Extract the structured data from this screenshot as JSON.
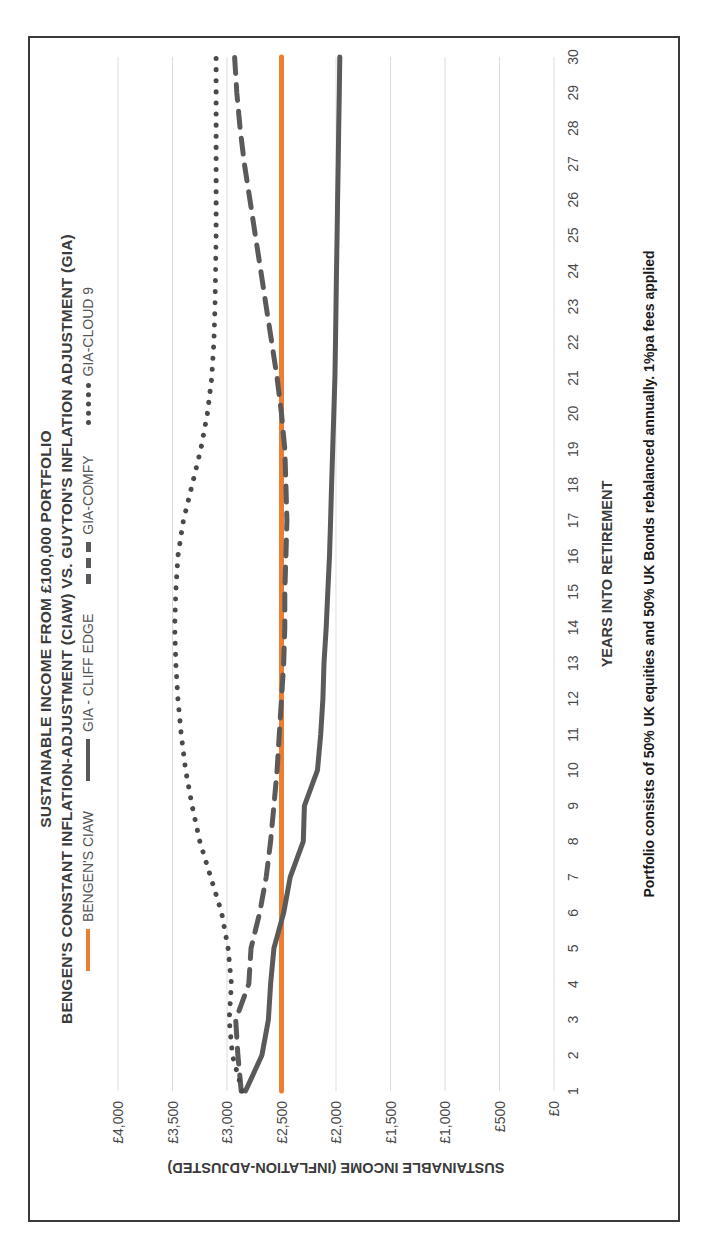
{
  "chart_data": {
    "type": "line",
    "title_line1": "SUSTAINABLE INCOME FROM £100,000 PORTFOLIO",
    "title_line2": "BENGEN'S CONSTANT INFLATION-ADJUSTMENT (CIAW) VS. GUYTON'S INFLATION ADJUSTMENT (GIA)",
    "xlabel": "YEARS INTO RETIREMENT",
    "ylabel": "SUSTAINABLE INCOME (INFLATION-ADJUSTED)",
    "footnote": "Portfolio consists of 50% UK equities and 50% UK Bonds rebalanced annually.  1%pa fees applied",
    "ylim": [
      0,
      4000
    ],
    "ytick_labels": [
      "£4,000",
      "£3,500",
      "£3,000",
      "£2,500",
      "£2,000",
      "£1,500",
      "£1,000",
      "£500",
      "£0"
    ],
    "ytick_values": [
      4000,
      3500,
      3000,
      2500,
      2000,
      1500,
      1000,
      500,
      0
    ],
    "grid": true,
    "legend_position": "top",
    "categories": [
      1,
      2,
      3,
      4,
      5,
      6,
      7,
      8,
      9,
      10,
      11,
      12,
      13,
      14,
      15,
      16,
      17,
      18,
      19,
      20,
      21,
      22,
      23,
      24,
      25,
      26,
      27,
      28,
      29,
      30
    ],
    "xtick_labels": [
      "1",
      "2",
      "3",
      "4",
      "5",
      "6",
      "7",
      "8",
      "9",
      "10",
      "11",
      "12",
      "13",
      "14",
      "15",
      "16",
      "17",
      "18",
      "19",
      "20",
      "21",
      "22",
      "23",
      "24",
      "25",
      "26",
      "27",
      "28",
      "29",
      "30"
    ],
    "series": [
      {
        "name": "BENGEN'S CIAW",
        "color": "#ED7D31",
        "style": "solid",
        "width": 5,
        "values": [
          2500,
          2500,
          2500,
          2500,
          2500,
          2500,
          2500,
          2500,
          2500,
          2500,
          2500,
          2500,
          2500,
          2500,
          2500,
          2500,
          2500,
          2500,
          2500,
          2500,
          2500,
          2500,
          2500,
          2500,
          2500,
          2500,
          2500,
          2500,
          2500,
          2500
        ]
      },
      {
        "name": "GIA - CLIFF EDGE",
        "color": "#5A5A5A",
        "style": "solid",
        "width": 5,
        "values": [
          2830,
          2680,
          2620,
          2600,
          2570,
          2480,
          2420,
          2300,
          2290,
          2170,
          2140,
          2120,
          2110,
          2090,
          2075,
          2060,
          2050,
          2040,
          2030,
          2020,
          2010,
          2005,
          2000,
          1995,
          1990,
          1985,
          1980,
          1975,
          1970,
          1965
        ]
      },
      {
        "name": "GIA-COMFY",
        "color": "#5A5A5A",
        "style": "dashed",
        "width": 5,
        "values": [
          2870,
          2900,
          2920,
          2800,
          2780,
          2700,
          2640,
          2600,
          2570,
          2540,
          2520,
          2500,
          2480,
          2470,
          2470,
          2460,
          2450,
          2460,
          2470,
          2500,
          2540,
          2590,
          2640,
          2690,
          2740,
          2790,
          2840,
          2880,
          2910,
          2930
        ]
      },
      {
        "name": "GIA-CLOUD 9",
        "color": "#4a4a4a",
        "style": "dotted",
        "width": 5,
        "values": [
          2860,
          2950,
          2980,
          2960,
          2990,
          3050,
          3150,
          3250,
          3320,
          3380,
          3420,
          3450,
          3470,
          3480,
          3470,
          3450,
          3400,
          3320,
          3240,
          3180,
          3140,
          3120,
          3110,
          3105,
          3100,
          3100,
          3100,
          3100,
          3100,
          3100
        ]
      }
    ]
  },
  "legend": [
    {
      "label": "BENGEN'S CIAW",
      "swatch": "solid-orange"
    },
    {
      "label": "GIA - CLIFF EDGE",
      "swatch": "solid-grey"
    },
    {
      "label": "GIA-COMFY",
      "swatch": "dashed-grey"
    },
    {
      "label": "GIA-CLOUD 9",
      "swatch": "dotted-grey"
    }
  ],
  "colors": {
    "accent_orange": "#ED7D31",
    "series_grey": "#5A5A5A",
    "grid": "#dddddd",
    "text": "#3b3b3b",
    "frame_border": "#3a3a3a"
  }
}
